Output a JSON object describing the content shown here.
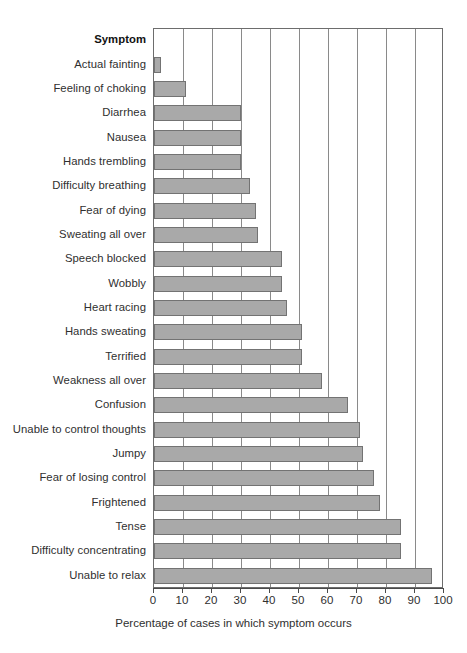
{
  "chart_data": {
    "type": "bar",
    "orientation": "horizontal",
    "title": "",
    "subtitle": "",
    "xlabel": "Percentage of cases in which symptom occurs",
    "ylabel": "Symptom",
    "xlim": [
      0,
      100
    ],
    "xticks": [
      0,
      10,
      20,
      30,
      40,
      50,
      60,
      70,
      80,
      90,
      100
    ],
    "xtick_labels": [
      "0",
      "10",
      "20",
      "30",
      "40",
      "50",
      "60",
      "70",
      "80",
      "90",
      "100"
    ],
    "grid": "vertical",
    "legend": null,
    "legend_position": "none",
    "bar_color": "#a9a9a9",
    "bar_border_color": "#737373",
    "axis_color": "#6d6d6d",
    "categories": [
      "Actual fainting",
      "Feeling of choking",
      "Diarrhea",
      "Nausea",
      "Hands trembling",
      "Difficulty breathing",
      "Fear of dying",
      "Sweating all over",
      "Speech blocked",
      "Wobbly",
      "Heart racing",
      "Hands sweating",
      "Terrified",
      "Weakness all over",
      "Confusion",
      "Unable to control thoughts",
      "Jumpy",
      "Fear of losing control",
      "Frightened",
      "Tense",
      "Difficulty concentrating",
      "Unable to relax"
    ],
    "values": [
      2.5,
      11,
      30,
      30,
      30,
      33,
      35,
      36,
      44,
      44,
      46,
      51,
      51,
      58,
      67,
      71,
      72,
      76,
      78,
      85,
      85,
      96
    ]
  },
  "axis": {
    "category_header": "Symptom"
  }
}
